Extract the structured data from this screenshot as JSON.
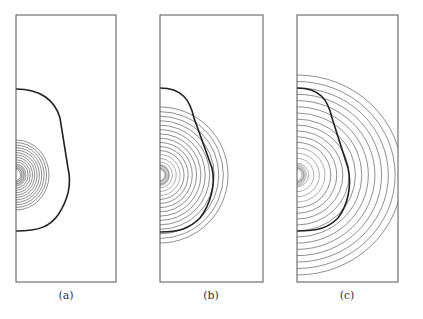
{
  "figure": {
    "colors": {
      "frame": "#555555",
      "contour": "#444444",
      "boundary": "#222222",
      "background": "#ffffff"
    },
    "panels": [
      {
        "id": "a",
        "label": "(a)",
        "frame": {
          "x": 16,
          "y": 15,
          "w": 100,
          "h": 267
        },
        "source": {
          "x": 16,
          "y": 175
        },
        "contour_count": 14,
        "contour_max_rx": 33,
        "contour_max_ry": 35,
        "boundary_path": "M16,89 C40,89 55,100 60,118 L68,168 C72,185 68,200 58,215 C50,226 40,231 16,231",
        "label_pos": {
          "x": 66,
          "y": 292
        }
      },
      {
        "id": "b",
        "label": "(b)",
        "frame": {
          "x": 160,
          "y": 15,
          "w": 103,
          "h": 267
        },
        "source": {
          "x": 160,
          "y": 175
        },
        "contour_count": 16,
        "contour_max_rx": 68,
        "contour_max_ry": 68,
        "boundary_path": "M160,88 C182,88 190,100 194,118 L212,168 C216,185 210,205 200,218 C190,228 180,232 160,232",
        "label_pos": {
          "x": 211,
          "y": 295
        }
      },
      {
        "id": "c",
        "label": "(c)",
        "frame": {
          "x": 297,
          "y": 15,
          "w": 101,
          "h": 267
        },
        "source": {
          "x": 297,
          "y": 175
        },
        "contour_count": 17,
        "contour_max_rx": 105,
        "contour_max_ry": 100,
        "boundary_path": "M297,88 C320,88 328,100 332,118 L348,168 C352,185 348,205 338,218 C328,228 318,231 297,231",
        "label_pos": {
          "x": 347,
          "y": 295
        }
      }
    ]
  }
}
